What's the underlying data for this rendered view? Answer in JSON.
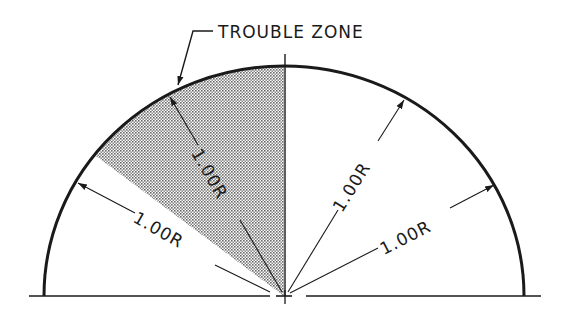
{
  "diagram": {
    "title_label": "TROUBLE ZONE",
    "dimensions": [
      {
        "id": "left",
        "label": "1.00R"
      },
      {
        "id": "shaded",
        "label": "1.00R"
      },
      {
        "id": "upper-right",
        "label": "1.00R"
      },
      {
        "id": "lower-right",
        "label": "1.00R"
      }
    ],
    "colors": {
      "line": "#1a1a1a",
      "shade": "#c8c8c8",
      "background": "#ffffff"
    }
  }
}
